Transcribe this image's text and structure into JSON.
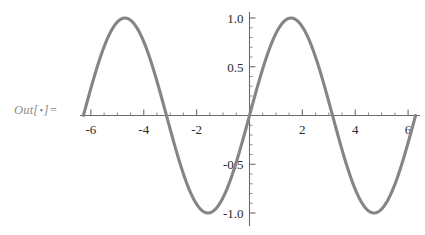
{
  "cell": {
    "label_prefix": "Out[",
    "label_dot": "▪",
    "label_suffix": "]=",
    "label_full": "Out[ ▪ ]="
  },
  "style": {
    "curve_color": "#858585",
    "axis_color": "#6b6b6b",
    "label_color": "#8c8c8c",
    "tick_text_color": "#2b2b2b",
    "background": "#ffffff"
  },
  "chart_data": {
    "type": "line",
    "title": "",
    "xlabel": "",
    "ylabel": "",
    "expression": "sin(x)",
    "xlim": [
      -6.283185307,
      6.283185307
    ],
    "ylim": [
      -1.0,
      1.0
    ],
    "grid": false,
    "legend": null,
    "x_major_ticks": [
      -6,
      -4,
      -2,
      2,
      4,
      6
    ],
    "x_major_tick_labels": [
      "-6",
      "-4",
      "-2",
      "2",
      "4",
      "6"
    ],
    "x_minor_tick_step": 0.5,
    "y_major_ticks": [
      -1.0,
      -0.5,
      0.5,
      1.0
    ],
    "y_major_tick_labels": [
      "-1.0",
      "-0.5",
      "0.5",
      "1.0"
    ],
    "y_minor_tick_step": 0.1,
    "axis_origin": [
      0,
      0
    ],
    "series": [
      {
        "name": "sin(x)",
        "x": [
          -6.2832,
          -6.0,
          -5.75,
          -5.5,
          -5.25,
          -5.0,
          -4.7124,
          -4.5,
          -4.25,
          -4.0,
          -3.75,
          -3.5,
          -3.1416,
          -3.0,
          -2.75,
          -2.5,
          -2.25,
          -2.0,
          -1.5708,
          -1.25,
          -1.0,
          -0.75,
          -0.5,
          -0.25,
          0,
          0.25,
          0.5,
          0.75,
          1.0,
          1.25,
          1.5708,
          2.0,
          2.25,
          2.5,
          2.75,
          3.0,
          3.1416,
          3.5,
          3.75,
          4.0,
          4.25,
          4.5,
          4.7124,
          5.0,
          5.25,
          5.5,
          5.75,
          6.0,
          6.2832
        ],
        "y": [
          0.0,
          0.2794,
          0.5048,
          0.7055,
          0.8632,
          0.9589,
          1.0,
          0.9775,
          0.895,
          0.7568,
          0.5715,
          0.3508,
          0.0,
          -0.1411,
          -0.3817,
          -0.5985,
          -0.7781,
          -0.9093,
          -1.0,
          -0.949,
          -0.8415,
          -0.6816,
          -0.4794,
          -0.2474,
          0.0,
          0.2474,
          0.4794,
          0.6816,
          0.8415,
          0.949,
          1.0,
          0.9093,
          0.7781,
          0.5985,
          0.3817,
          0.1411,
          0.0,
          -0.3508,
          -0.5715,
          -0.7568,
          -0.895,
          -0.9775,
          -1.0,
          -0.9589,
          -0.8632,
          -0.7055,
          -0.5048,
          -0.2794,
          0.0
        ]
      }
    ],
    "maxima": [
      {
        "x": -4.7124,
        "y": 1.0
      },
      {
        "x": 1.5708,
        "y": 1.0
      }
    ],
    "minima": [
      {
        "x": -1.5708,
        "y": -1.0
      },
      {
        "x": 4.7124,
        "y": -1.0
      }
    ],
    "zero_crossings": [
      -6.2832,
      -3.1416,
      0,
      3.1416,
      6.2832
    ]
  }
}
